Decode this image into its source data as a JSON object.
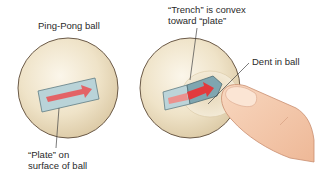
{
  "diagram": {
    "left_panel": {
      "title": "Ping-Pong ball",
      "plate_label_line1": "“Plate” on",
      "plate_label_line2": "surface of ball"
    },
    "right_panel": {
      "trench_label_line1": "“Trench” is convex",
      "trench_label_line2": "toward “plate”",
      "dent_label": "Dent in ball"
    },
    "colors": {
      "ball_fill": "#efe3c8",
      "ball_edge": "#6b5a48",
      "plate_fill": "#b9d3d8",
      "plate_edge": "#5f7c84",
      "arrow": "#e8575a",
      "finger": "#f4c7a8",
      "finger_edge": "#c98e70"
    }
  }
}
